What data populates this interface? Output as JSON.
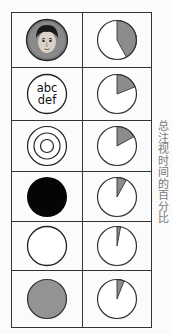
{
  "chart_data": {
    "type": "pie",
    "title": "",
    "ylabel": "总注视时间的百分比",
    "categories": [
      "face",
      "text abc def",
      "concentric circles",
      "black circle",
      "white circle",
      "gray circle"
    ],
    "values": [
      42,
      19,
      17,
      8,
      3,
      6
    ],
    "unit": "%",
    "layout": "table of stimulus icons (left) with pie charts (right), one row per stimulus",
    "colors": {
      "slice": "#8c8c8c",
      "remainder": "#ffffff",
      "outline": "#333333"
    }
  },
  "rows": [
    {
      "stimulus": "face",
      "percent": 42
    },
    {
      "stimulus": "text",
      "line1": "abc",
      "line2": "def",
      "percent": 19
    },
    {
      "stimulus": "bullseye",
      "percent": 17
    },
    {
      "stimulus": "black",
      "percent": 8
    },
    {
      "stimulus": "white",
      "percent": 3
    },
    {
      "stimulus": "gray",
      "percent": 6
    }
  ],
  "axis_label": "总注视时间的百分比"
}
